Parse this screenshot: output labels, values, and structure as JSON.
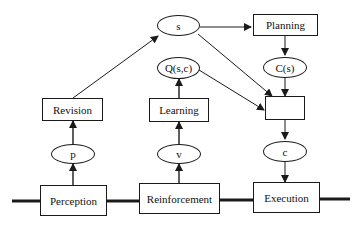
{
  "diagram": {
    "nodes": {
      "s": "s",
      "planning": "Planning",
      "q": "Q(s,c)",
      "cs": "C(s)",
      "revision": "Revision",
      "learning": "Learning",
      "decision": "",
      "p": "p",
      "v": "v",
      "c": "c",
      "perception": "Perception",
      "reinforcement": "Reinforcement",
      "execution": "Execution"
    },
    "edges": [
      {
        "from": "revision",
        "to": "s"
      },
      {
        "from": "s",
        "to": "planning"
      },
      {
        "from": "s",
        "to": "decision"
      },
      {
        "from": "planning",
        "to": "cs"
      },
      {
        "from": "cs",
        "to": "decision"
      },
      {
        "from": "q",
        "to": "decision"
      },
      {
        "from": "learning",
        "to": "q"
      },
      {
        "from": "v",
        "to": "learning"
      },
      {
        "from": "reinforcement",
        "to": "v"
      },
      {
        "from": "p",
        "to": "revision"
      },
      {
        "from": "perception",
        "to": "p"
      },
      {
        "from": "decision",
        "to": "c"
      },
      {
        "from": "c",
        "to": "execution"
      }
    ],
    "colors": {
      "stroke": "#1a1a1a",
      "background": "#ffffff"
    }
  }
}
